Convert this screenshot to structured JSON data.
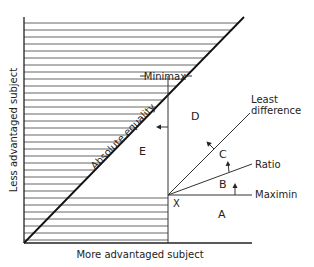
{
  "diagram": {
    "axes": {
      "x_label": "More advantaged subject",
      "y_label": "Less advantaged subject"
    },
    "lines": {
      "absolute_equality": "Absolute equality",
      "minimax": "Minimax",
      "least_difference_line1": "Least",
      "least_difference_line2": "difference",
      "ratio": "Ratio",
      "maximin": "Maximin"
    },
    "point": "X",
    "regions": {
      "a": "A",
      "b": "B",
      "c": "C",
      "d": "D",
      "e": "E"
    },
    "colors": {
      "line": "#222222",
      "hatch": "#555555",
      "background": "#ffffff"
    }
  }
}
